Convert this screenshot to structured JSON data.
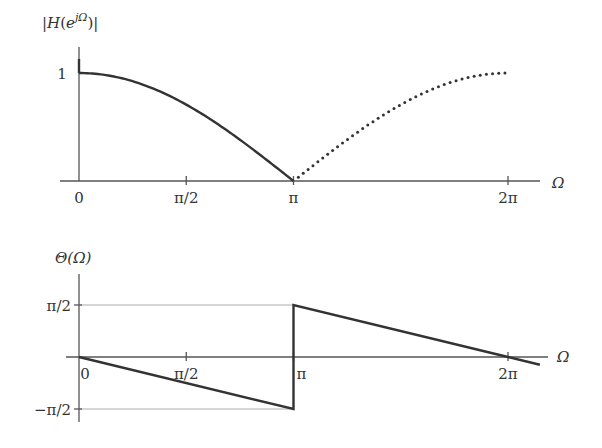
{
  "chart_data": [
    {
      "type": "line",
      "title": "",
      "ylabel": "|H(e^{jΩ})|",
      "xlabel": "Ω",
      "xlim": [
        0,
        6.9
      ],
      "ylim": [
        0,
        1.15
      ],
      "x_ticks": [
        {
          "value": 0,
          "label": "0"
        },
        {
          "value": 1.5708,
          "label": "π/2"
        },
        {
          "value": 3.1416,
          "label": "π"
        },
        {
          "value": 6.2832,
          "label": "2π"
        }
      ],
      "y_ticks": [
        {
          "value": 1,
          "label": "1"
        }
      ],
      "series": [
        {
          "name": "magnitude (0 to π)",
          "style": "solid",
          "function": "|cos(Ω/2)|",
          "x": [
            0,
            0.3927,
            0.7854,
            1.1781,
            1.5708,
            1.9635,
            2.3562,
            2.7489,
            3.1416
          ],
          "y": [
            1.0,
            0.981,
            0.924,
            0.831,
            0.707,
            0.556,
            0.383,
            0.195,
            0.0
          ]
        },
        {
          "name": "magnitude (π to 2π)",
          "style": "dotted",
          "function": "|cos(Ω/2)|",
          "x": [
            3.1416,
            3.5343,
            3.927,
            4.3197,
            4.7124,
            5.1051,
            5.4978,
            5.8905,
            6.2832
          ],
          "y": [
            0.0,
            0.195,
            0.383,
            0.556,
            0.707,
            0.831,
            0.924,
            0.981,
            1.0
          ]
        }
      ]
    },
    {
      "type": "line",
      "title": "",
      "ylabel": "Θ(Ω)",
      "xlabel": "Ω",
      "xlim": [
        0,
        6.9
      ],
      "ylim": [
        -1.5708,
        1.5708
      ],
      "x_ticks": [
        {
          "value": 0,
          "label": "0"
        },
        {
          "value": 1.5708,
          "label": "π/2"
        },
        {
          "value": 3.1416,
          "label": "π"
        },
        {
          "value": 6.2832,
          "label": "2π"
        }
      ],
      "y_ticks": [
        {
          "value": 1.5708,
          "label": "π/2"
        },
        {
          "value": -1.5708,
          "label": "−π/2"
        }
      ],
      "series": [
        {
          "name": "phase",
          "style": "solid",
          "function": "−Ω/2 for 0≤Ω<π; π−Ω/2 for Ω≥π",
          "x": [
            0,
            3.1416,
            3.1416,
            6.2832,
            6.75
          ],
          "y": [
            0,
            -1.5708,
            1.5708,
            0,
            -0.2334
          ]
        }
      ]
    }
  ]
}
